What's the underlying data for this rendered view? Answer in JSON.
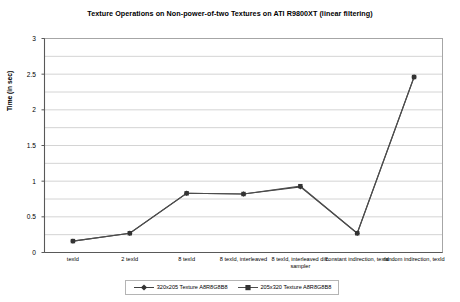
{
  "chart_data": {
    "type": "line",
    "title": "Texture Operations on Non-power-of-two Textures on ATI R9800XT (linear filtering)",
    "xlabel": "",
    "ylabel": "Time (in sec)",
    "ylim": [
      0,
      3
    ],
    "ytick_step": 0.5,
    "gridline_step": 0.25,
    "grid": true,
    "legend_position": "bottom",
    "categories": [
      "texId",
      "2 texId",
      "8 texId",
      "8 texId, interleaved",
      "8 texId, interleaved diff. sampler",
      "constant indirection, texId",
      "random indirection, texId"
    ],
    "ytick_labels": [
      "0",
      "0.5",
      "1",
      "1.5",
      "2",
      "2.5",
      "3"
    ],
    "ytick_values": [
      0,
      0.5,
      1,
      1.5,
      2,
      2.5,
      3
    ],
    "series": [
      {
        "name": "320x205 Texture A8R8G8B8",
        "marker": "diamond",
        "color": "#404040",
        "values": [
          0.16,
          0.27,
          0.83,
          0.82,
          0.92,
          0.27,
          2.46
        ]
      },
      {
        "name": "205x320 Texture A8R8G8B8",
        "marker": "square",
        "color": "#4d4d4d",
        "values": [
          0.16,
          0.27,
          0.83,
          0.82,
          0.93,
          0.27,
          2.46
        ]
      }
    ]
  },
  "colors": {
    "plot_border": "#a6a6a6",
    "gridline": "#d4d4d4",
    "axis": "#808080",
    "series_1": "#404040",
    "series_2": "#4d4d4d",
    "legend_border": "#b4b4b4"
  }
}
